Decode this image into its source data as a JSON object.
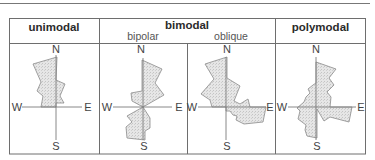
{
  "header": {
    "unimodal": "unimodal",
    "bimodal": "bimodal",
    "bipolar": "bipolar",
    "oblique": "oblique",
    "polymodal": "polymodal"
  },
  "compass": {
    "north": "N",
    "south": "S",
    "east": "E",
    "west": "W"
  },
  "colors": {
    "border": "#6e6e6e",
    "fill": "#e4e4e4",
    "stroke": "#8a8a8a",
    "axis": "#7a7a7a"
  },
  "roses": [
    {
      "name": "unimodal",
      "center": [
        56,
        107
      ]
    },
    {
      "name": "bipolar",
      "center": [
        143,
        107
      ]
    },
    {
      "name": "oblique",
      "center": [
        226,
        107
      ]
    },
    {
      "name": "polymodal",
      "center": [
        316,
        107
      ]
    }
  ]
}
